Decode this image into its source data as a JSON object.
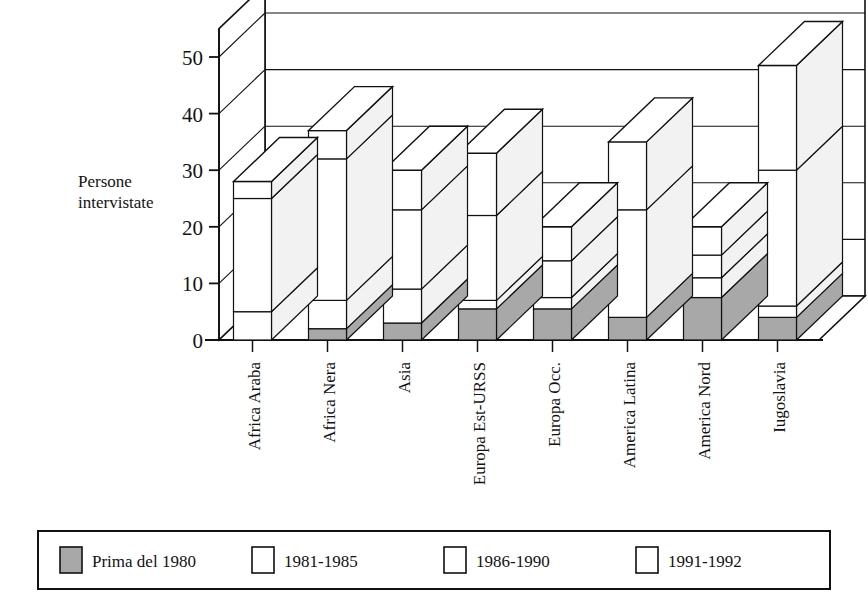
{
  "chart_data": {
    "type": "bar",
    "subtype": "stacked-3d-column",
    "title": "",
    "xlabel": "",
    "ylabel": "Persone intervistate",
    "ylim": [
      0,
      55
    ],
    "yticks": [
      0,
      10,
      20,
      30,
      40,
      50
    ],
    "ytick_labels": [
      "0",
      "10",
      "20",
      "30",
      "40",
      "50"
    ],
    "grid": true,
    "legend_position": "bottom",
    "categories": [
      "Africa Araba",
      "Africa Nera",
      "Asia",
      "Europa Est-URSS",
      "Europa Occ.",
      "America Latina",
      "America Nord",
      "Iugoslavia"
    ],
    "series": [
      {
        "name": "Prima del 1980",
        "fill": "#a8a8a8",
        "values": [
          0,
          2,
          3,
          5.5,
          5.5,
          4,
          7.5,
          4
        ]
      },
      {
        "name": "1981-1985",
        "fill": "#ffffff",
        "values": [
          5,
          5,
          6,
          1.5,
          2,
          0,
          3.5,
          2
        ]
      },
      {
        "name": "1986-1990",
        "fill": "#ffffff",
        "values": [
          20,
          25,
          14,
          15,
          6.5,
          19,
          4,
          24
        ]
      },
      {
        "name": "1991-1992",
        "fill": "#ffffff",
        "values": [
          3,
          5,
          7,
          11,
          6,
          12,
          5,
          18.5
        ]
      }
    ],
    "totals": [
      28,
      37,
      30,
      33,
      20,
      35,
      20,
      48.5
    ],
    "annotations": []
  },
  "legend": {
    "items": [
      {
        "label": "Prima del 1980",
        "swatch": "#a8a8a8"
      },
      {
        "label": "1981-1985",
        "swatch": "#ffffff"
      },
      {
        "label": "1986-1990",
        "swatch": "#ffffff"
      },
      {
        "label": "1991-1992",
        "swatch": "#ffffff"
      }
    ]
  },
  "colors": {
    "stroke": "#111111",
    "shaded": "#a8a8a8",
    "plain": "#ffffff",
    "side_face": "#f2f2f2",
    "top_face": "#ffffff",
    "background": "#ffffff"
  }
}
